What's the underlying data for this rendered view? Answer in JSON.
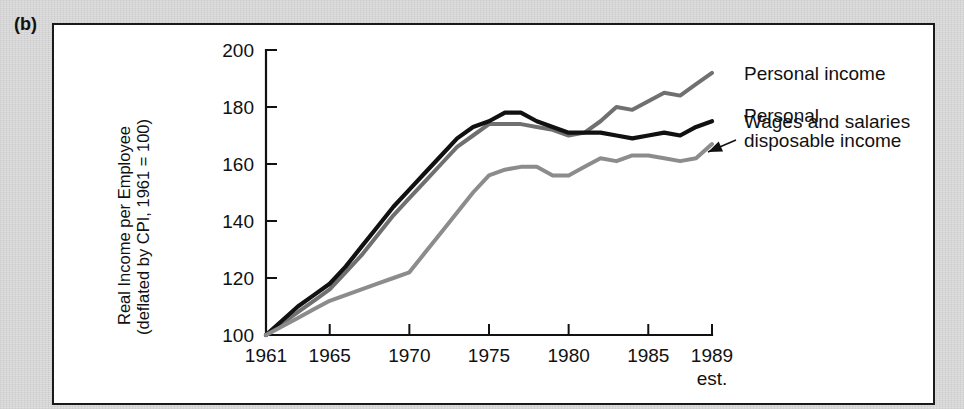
{
  "panel": {
    "letter": "(b)"
  },
  "chart_data": {
    "type": "line",
    "title": "",
    "xlabel": "",
    "ylabel": "Real Income per Employee (deflated by CPI, 1961 = 100)",
    "ylabel_line1": "Real Income per Employee",
    "ylabel_line2": "(deflated by CPI, 1961 = 100)",
    "ylim": [
      100,
      200
    ],
    "xlim": [
      1961,
      1989
    ],
    "grid": false,
    "legend_position": "right-inline",
    "y_ticks": [
      100,
      120,
      140,
      160,
      180,
      200
    ],
    "x_ticks": [
      1961,
      1965,
      1970,
      1975,
      1980,
      1985,
      1989
    ],
    "x_tick_labels": [
      "1961",
      "1965",
      "1970",
      "1975",
      "1980",
      "1985",
      "1989"
    ],
    "x_tick_sublabel": "est.",
    "x_tick_sublabel_at": 1989,
    "x": [
      1961,
      1962,
      1963,
      1964,
      1965,
      1966,
      1967,
      1968,
      1969,
      1970,
      1971,
      1972,
      1973,
      1974,
      1975,
      1976,
      1977,
      1978,
      1979,
      1980,
      1981,
      1982,
      1983,
      1984,
      1985,
      1986,
      1987,
      1988,
      1989
    ],
    "series": [
      {
        "name": "Personal income",
        "color": "#707070",
        "width": 4.0,
        "values": [
          100,
          104,
          108,
          112,
          116,
          122,
          128,
          135,
          142,
          148,
          154,
          160,
          166,
          170,
          174,
          174,
          174,
          173,
          172,
          170,
          171,
          175,
          180,
          179,
          182,
          185,
          184,
          188,
          192
        ]
      },
      {
        "name": "Wages and salaries",
        "color": "#111111",
        "width": 4.2,
        "values": [
          100,
          105,
          110,
          114,
          118,
          124,
          131,
          138,
          145,
          151,
          157,
          163,
          169,
          173,
          175,
          178,
          178,
          175,
          173,
          171,
          171,
          171,
          170,
          169,
          170,
          171,
          170,
          173,
          175
        ]
      },
      {
        "name": "Personal disposable income",
        "color": "#8c8c8c",
        "width": 4.0,
        "values": [
          100,
          103,
          106,
          109,
          112,
          114,
          116,
          118,
          120,
          122,
          129,
          136,
          143,
          150,
          156,
          158,
          159,
          159,
          156,
          156,
          159,
          162,
          161,
          163,
          163,
          162,
          161,
          162,
          167
        ]
      }
    ],
    "annotations": [
      {
        "text_line1": "Personal income",
        "text_line2": "",
        "target_series": "Personal income"
      },
      {
        "text_line1": "Wages and salaries",
        "text_line2": "",
        "target_series": "Wages and salaries"
      },
      {
        "text_line1": "Personal",
        "text_line2": "disposable income",
        "target_series": "Personal disposable income",
        "arrow": true
      }
    ]
  },
  "legend": {
    "items": [
      {
        "label": "Personal income"
      },
      {
        "label": "Wages and salaries"
      },
      {
        "label_line1": "Personal",
        "label_line2": "disposable income"
      }
    ]
  }
}
